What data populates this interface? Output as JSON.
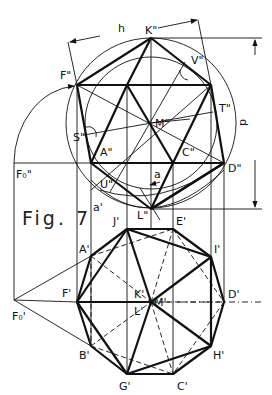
{
  "figure": {
    "caption": "Fig. 7",
    "dimensions": {
      "h": "h",
      "d": "d",
      "a": "a",
      "a_prime": "a'"
    },
    "top_view_labels": {
      "K2": "K\"",
      "F2": "F\"",
      "V2": "V\"",
      "T2": "T\"",
      "M2": "M\"",
      "S2": "S\"",
      "A2": "A\"",
      "C2": "C\"",
      "D2": "D\"",
      "U2": "U\"",
      "L2": "L\"",
      "F0_2": "F₀\""
    },
    "bottom_view_labels": {
      "J1": "J'",
      "E1": "E'",
      "A1": "A'",
      "I1": "I'",
      "F1": "F'",
      "K1": "K'",
      "M1": "M'",
      "D1": "D'",
      "L1": "L'",
      "B1": "B'",
      "H1": "H'",
      "G1": "G'",
      "C1": "C'",
      "F0_1": "F₀'"
    }
  }
}
